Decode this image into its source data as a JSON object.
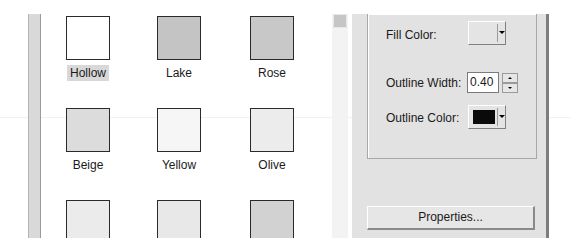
{
  "palette": {
    "swatches": [
      {
        "label": "Hollow",
        "color": "#ffffff",
        "selected": true
      },
      {
        "label": "Lake",
        "color": "#c4c4c4",
        "selected": false
      },
      {
        "label": "Rose",
        "color": "#c8c8c8",
        "selected": false
      },
      {
        "label": "Beige",
        "color": "#dcdcdc",
        "selected": false
      },
      {
        "label": "Yellow",
        "color": "#f6f6f6",
        "selected": false
      },
      {
        "label": "Olive",
        "color": "#ececec",
        "selected": false
      },
      {
        "label": "",
        "color": "#ebebeb",
        "selected": false
      },
      {
        "label": "",
        "color": "#e8e8e8",
        "selected": false
      },
      {
        "label": "",
        "color": "#d2d2d2",
        "selected": false
      }
    ]
  },
  "properties": {
    "fill_color_label": "Fill Color:",
    "fill_color_value": "#e4e4e4",
    "outline_width_label": "Outline Width:",
    "outline_width_value": "0.40",
    "outline_color_label": "Outline Color:",
    "outline_color_value": "#0a0a0a",
    "properties_button": "Properties..."
  }
}
